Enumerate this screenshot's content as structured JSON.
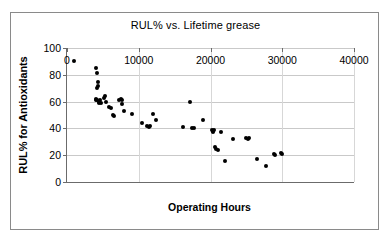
{
  "chart_data": {
    "type": "scatter",
    "title": "RUL% vs. Lifetime grease",
    "xlabel": "Operating Hours",
    "ylabel": "RUL% for Antioxidants",
    "xlim": [
      0,
      40000
    ],
    "ylim": [
      0,
      100
    ],
    "xticks": [
      "0",
      "10000",
      "20000",
      "30000",
      "40000"
    ],
    "xtick_values": [
      0,
      10000,
      20000,
      30000,
      40000
    ],
    "yticks": [
      "0",
      "20",
      "40",
      "60",
      "80",
      "100"
    ],
    "ytick_values": [
      0,
      20,
      40,
      60,
      80,
      100
    ],
    "grid": "horizontal",
    "legend": null,
    "marker": "filled-circle",
    "marker_color": "#000000",
    "points": [
      [
        1000,
        90
      ],
      [
        4100,
        85
      ],
      [
        4200,
        81
      ],
      [
        4300,
        75
      ],
      [
        4300,
        72
      ],
      [
        4250,
        70
      ],
      [
        4000,
        62
      ],
      [
        4100,
        61
      ],
      [
        4200,
        61
      ],
      [
        4400,
        60
      ],
      [
        4450,
        59
      ],
      [
        4600,
        61
      ],
      [
        4700,
        59
      ],
      [
        5100,
        63
      ],
      [
        5300,
        64
      ],
      [
        5500,
        60
      ],
      [
        5900,
        56
      ],
      [
        6200,
        55
      ],
      [
        6400,
        50
      ],
      [
        6600,
        49
      ],
      [
        7300,
        61
      ],
      [
        7500,
        62
      ],
      [
        7600,
        61
      ],
      [
        7700,
        58
      ],
      [
        7900,
        53
      ],
      [
        9000,
        51
      ],
      [
        10400,
        44
      ],
      [
        11200,
        42
      ],
      [
        11400,
        41
      ],
      [
        11600,
        42
      ],
      [
        12000,
        51
      ],
      [
        12400,
        46
      ],
      [
        16200,
        41
      ],
      [
        17200,
        60
      ],
      [
        17400,
        40
      ],
      [
        17700,
        40
      ],
      [
        18900,
        46
      ],
      [
        20200,
        39
      ],
      [
        20400,
        38
      ],
      [
        20500,
        39
      ],
      [
        20300,
        37
      ],
      [
        20600,
        26
      ],
      [
        20800,
        25
      ],
      [
        21000,
        24
      ],
      [
        21400,
        37
      ],
      [
        22000,
        16
      ],
      [
        23200,
        32
      ],
      [
        24900,
        33
      ],
      [
        25200,
        32
      ],
      [
        25300,
        33
      ],
      [
        26500,
        17
      ],
      [
        27700,
        12
      ],
      [
        28800,
        21
      ],
      [
        29000,
        20
      ],
      [
        29800,
        22
      ],
      [
        29900,
        21
      ]
    ]
  }
}
